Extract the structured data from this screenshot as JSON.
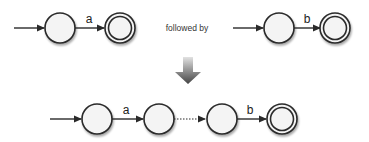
{
  "diagram": {
    "colors": {
      "stroke": "#2a2a2a",
      "state_fill": "#f4f4f4",
      "arrow_light": "#d6d6d6",
      "arrow_dark": "#4a4a4a"
    },
    "top_left": {
      "states": [
        {
          "id": "q0",
          "start": true,
          "accepting": false
        },
        {
          "id": "q1",
          "start": false,
          "accepting": true
        }
      ],
      "transitions": [
        {
          "from": "q0",
          "to": "q1",
          "label": "a",
          "style": "solid"
        }
      ]
    },
    "connector_text": "followed by",
    "top_right": {
      "states": [
        {
          "id": "p0",
          "start": true,
          "accepting": false
        },
        {
          "id": "p1",
          "start": false,
          "accepting": true
        }
      ],
      "transitions": [
        {
          "from": "p0",
          "to": "p1",
          "label": "b",
          "style": "solid"
        }
      ]
    },
    "result_arrow": "down-arrow",
    "bottom": {
      "states": [
        {
          "id": "r0",
          "start": true,
          "accepting": false
        },
        {
          "id": "r1",
          "start": false,
          "accepting": false
        },
        {
          "id": "r2",
          "start": false,
          "accepting": false
        },
        {
          "id": "r3",
          "start": false,
          "accepting": true
        }
      ],
      "transitions": [
        {
          "from": "r0",
          "to": "r1",
          "label": "a",
          "style": "solid"
        },
        {
          "from": "r1",
          "to": "r2",
          "label": "",
          "style": "dotted"
        },
        {
          "from": "r2",
          "to": "r3",
          "label": "b",
          "style": "solid"
        }
      ]
    }
  }
}
